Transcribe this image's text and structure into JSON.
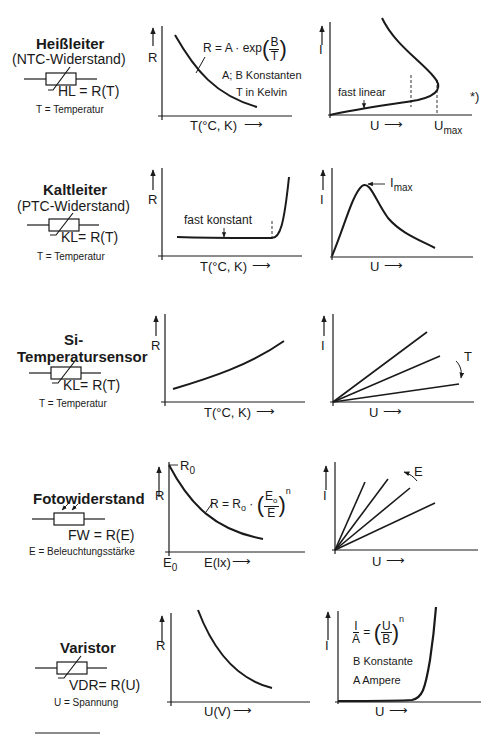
{
  "page": {
    "title_cut_off": "Temperaturab... (Übersicht)",
    "footnote_rule": true
  },
  "components": [
    {
      "name": "Heißleiter",
      "subtitle": "(NTC-Widerstand)",
      "symbol_label": "HL = R(T)",
      "variable_note": "T = Temperatur",
      "graph_left": {
        "y_label": "R",
        "x_label": "T(°C, K)",
        "formula": {
          "lhs": "R = A · exp",
          "num": "B",
          "den": "T"
        },
        "notes": [
          "A; B Konstanten",
          "T in Kelvin"
        ]
      },
      "graph_right": {
        "y_label": "I",
        "x_label": "U",
        "x_marker": "U",
        "x_marker_sub": "max",
        "annotation": "fast linear",
        "footnote_mark": "*)"
      }
    },
    {
      "name": "Kaltleiter",
      "subtitle": "(PTC-Widerstand)",
      "symbol_label": "KL= R(T)",
      "variable_note": "T = Temperatur",
      "graph_left": {
        "y_label": "R",
        "x_label": "T(°C, K)",
        "annotation": "fast konstant"
      },
      "graph_right": {
        "y_label": "I",
        "x_label": "U",
        "peak_label": "I",
        "peak_label_sub": "max"
      }
    },
    {
      "name": "Si-",
      "name_line2": "Temperatursensor",
      "symbol_label": "KL= R(T)",
      "variable_note": "T = Temperatur",
      "graph_left": {
        "y_label": "R",
        "x_label": "T(°C, K)"
      },
      "graph_right": {
        "y_label": "I",
        "x_label": "U",
        "param_label": "T"
      }
    },
    {
      "name": "Fotowiderstand",
      "symbol_label": "FW = R(E)",
      "variable_note": "E = Beleuchtungsstärke",
      "graph_left": {
        "y_label": "R",
        "x_label": "E(lx)",
        "y_marker": "R",
        "y_marker_sub": "0",
        "x_marker": "E",
        "x_marker_sub": "0",
        "formula": {
          "lhs": "R = R",
          "lhs_sub": "o",
          "mid": " · ",
          "num": "E",
          "num_sub": "o",
          "den": "E",
          "exp": "n"
        }
      },
      "graph_right": {
        "y_label": "I",
        "x_label": "U",
        "param_label": "E"
      }
    },
    {
      "name": "Varistor",
      "symbol_label": "VDR= R(U)",
      "variable_note": "U = Spannung",
      "graph_left": {
        "y_label": "R",
        "x_label": "U(V)"
      },
      "graph_right": {
        "y_label": "I",
        "x_label": "U",
        "formula": {
          "lhs_num": "I",
          "lhs_den": "A",
          "num": "U",
          "den": "B",
          "exp": "n"
        },
        "notes": [
          "B Konstante",
          "A Ampere"
        ]
      }
    }
  ],
  "glyphs": {
    "arrow_right": "⟶",
    "arrow_up": "↑"
  },
  "colors": {
    "ink": "#1a1a1a",
    "background": "#ffffff"
  }
}
